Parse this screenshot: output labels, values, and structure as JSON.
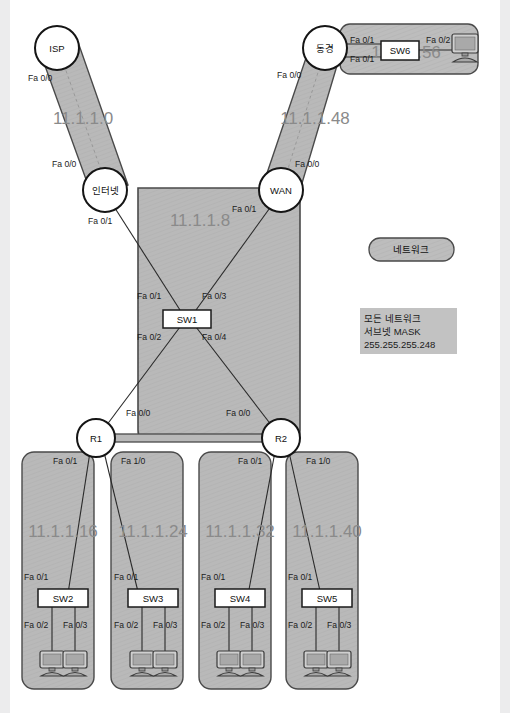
{
  "page": {
    "clipped_header_text": "",
    "background_color": "#ffffff",
    "margin_color": "#ececed"
  },
  "colors": {
    "segment_fill": "#b9b9b9",
    "segment_stroke": "#4a4a4a",
    "node_fill": "#ffffff",
    "node_stroke": "#151515",
    "network_label": "#8a8a8a",
    "legend_fill": "#c2c2c2",
    "pc_fill": "#b0b0b0",
    "pc_stroke": "#3a3a3a"
  },
  "routers": [
    {
      "id": "isp",
      "label": "ISP",
      "cx": 57,
      "cy": 48
    },
    {
      "id": "tokyo",
      "label": "동경",
      "cx": 325,
      "cy": 48
    },
    {
      "id": "internet",
      "label": "인터넷",
      "cx": 105,
      "cy": 190
    },
    {
      "id": "wan",
      "label": "WAN",
      "cx": 281,
      "cy": 190
    },
    {
      "id": "r1",
      "label": "R1",
      "cx": 96,
      "cy": 438
    },
    {
      "id": "r2",
      "label": "R2",
      "cx": 281,
      "cy": 438
    }
  ],
  "switches": [
    {
      "id": "sw1",
      "label": "SW1",
      "x": 163,
      "y": 310,
      "w": 48,
      "h": 17
    },
    {
      "id": "sw6",
      "label": "SW6",
      "x": 381,
      "y": 41,
      "w": 38,
      "h": 19
    },
    {
      "id": "sw2",
      "label": "SW2",
      "x": 38,
      "y": 589,
      "w": 50,
      "h": 18
    },
    {
      "id": "sw3",
      "label": "SW3",
      "x": 128,
      "y": 589,
      "w": 50,
      "h": 18
    },
    {
      "id": "sw4",
      "label": "SW4",
      "x": 215,
      "y": 589,
      "w": 50,
      "h": 18
    },
    {
      "id": "sw5",
      "label": "SW5",
      "x": 302,
      "y": 589,
      "w": 50,
      "h": 18
    }
  ],
  "networks": [
    {
      "id": "net-11-1-1-0",
      "label": "11.1.1.0",
      "x": 83,
      "y": 124
    },
    {
      "id": "net-11-1-1-48",
      "label": "11.1.1.48",
      "x": 315,
      "y": 124
    },
    {
      "id": "net-11-1-1-8",
      "label": "11.1.1.8",
      "x": 200,
      "y": 226
    },
    {
      "id": "net-11-1-1-56",
      "label": "11.1.1.56",
      "x": 406,
      "y": 58
    },
    {
      "id": "net-11-1-1-16",
      "label": "11.1.1.16",
      "x": 63,
      "y": 537
    },
    {
      "id": "net-11-1-1-24",
      "label": "11.1.1.24",
      "x": 153,
      "y": 537
    },
    {
      "id": "net-11-1-1-32",
      "label": "11.1.1.32",
      "x": 240,
      "y": 537
    },
    {
      "id": "net-11-1-1-40",
      "label": "11.1.1.40",
      "x": 327,
      "y": 537
    }
  ],
  "interface_labels": [
    {
      "id": "if-isp-fa00",
      "text": "Fa 0/0",
      "x": 28,
      "y": 81,
      "anchor": "start"
    },
    {
      "id": "if-internet-fa00",
      "text": "Fa 0/0",
      "x": 52,
      "y": 167,
      "anchor": "start"
    },
    {
      "id": "if-tokyo-fa00",
      "text": "Fa 0/0",
      "x": 277,
      "y": 78,
      "anchor": "start"
    },
    {
      "id": "if-wan-fa00",
      "text": "Fa 0/0",
      "x": 295,
      "y": 167,
      "anchor": "start"
    },
    {
      "id": "if-tokyo-fa01-a",
      "text": "Fa 0/1",
      "x": 350,
      "y": 43,
      "anchor": "start"
    },
    {
      "id": "if-tokyo-fa01-b",
      "text": "Fa 0/1",
      "x": 350,
      "y": 62,
      "anchor": "start"
    },
    {
      "id": "if-sw6-fa02",
      "text": "Fa 0/2",
      "x": 426,
      "y": 43,
      "anchor": "start"
    },
    {
      "id": "if-internet-fa01",
      "text": "Fa 0/1",
      "x": 88,
      "y": 224,
      "anchor": "start"
    },
    {
      "id": "if-wan-fa01",
      "text": "Fa 0/1",
      "x": 232,
      "y": 212,
      "anchor": "start"
    },
    {
      "id": "if-sw1-fa01",
      "text": "Fa 0/1",
      "x": 137,
      "y": 299,
      "anchor": "start"
    },
    {
      "id": "if-sw1-fa03",
      "text": "Fa 0/3",
      "x": 202,
      "y": 299,
      "anchor": "start"
    },
    {
      "id": "if-sw1-fa02",
      "text": "Fa 0/2",
      "x": 137,
      "y": 340,
      "anchor": "start"
    },
    {
      "id": "if-sw1-fa04",
      "text": "Fa 0/4",
      "x": 202,
      "y": 340,
      "anchor": "start"
    },
    {
      "id": "if-r1-fa00",
      "text": "Fa 0/0",
      "x": 126,
      "y": 416,
      "anchor": "start"
    },
    {
      "id": "if-r2-fa00",
      "text": "Fa 0/0",
      "x": 226,
      "y": 416,
      "anchor": "start"
    },
    {
      "id": "if-r1-fa01",
      "text": "Fa 0/1",
      "x": 53,
      "y": 464,
      "anchor": "start"
    },
    {
      "id": "if-r1-fa10",
      "text": "Fa 1/0",
      "x": 121,
      "y": 464,
      "anchor": "start"
    },
    {
      "id": "if-r2-fa01",
      "text": "Fa 0/1",
      "x": 238,
      "y": 464,
      "anchor": "start"
    },
    {
      "id": "if-r2-fa10",
      "text": "Fa 1/0",
      "x": 306,
      "y": 464,
      "anchor": "start"
    },
    {
      "id": "if-sw2-fa01",
      "text": "Fa 0/1",
      "x": 24,
      "y": 580,
      "anchor": "start"
    },
    {
      "id": "if-sw3-fa01",
      "text": "Fa 0/1",
      "x": 114,
      "y": 580,
      "anchor": "start"
    },
    {
      "id": "if-sw4-fa01",
      "text": "Fa 0/1",
      "x": 201,
      "y": 580,
      "anchor": "start"
    },
    {
      "id": "if-sw5-fa01",
      "text": "Fa 0/1",
      "x": 288,
      "y": 580,
      "anchor": "start"
    },
    {
      "id": "if-sw2-fa02",
      "text": "Fa 0/2",
      "x": 24,
      "y": 628,
      "anchor": "start"
    },
    {
      "id": "if-sw2-fa03",
      "text": "Fa 0/3",
      "x": 63,
      "y": 628,
      "anchor": "start"
    },
    {
      "id": "if-sw3-fa02",
      "text": "Fa 0/2",
      "x": 114,
      "y": 628,
      "anchor": "start"
    },
    {
      "id": "if-sw3-fa03",
      "text": "Fa 0/3",
      "x": 153,
      "y": 628,
      "anchor": "start"
    },
    {
      "id": "if-sw4-fa02",
      "text": "Fa 0/2",
      "x": 201,
      "y": 628,
      "anchor": "start"
    },
    {
      "id": "if-sw4-fa03",
      "text": "Fa 0/3",
      "x": 240,
      "y": 628,
      "anchor": "start"
    },
    {
      "id": "if-sw5-fa02",
      "text": "Fa 0/2",
      "x": 288,
      "y": 628,
      "anchor": "start"
    },
    {
      "id": "if-sw5-fa03",
      "text": "Fa 0/3",
      "x": 327,
      "y": 628,
      "anchor": "start"
    }
  ],
  "legend": {
    "pill_label": "네트워크",
    "note_lines": [
      "모든 네트워크",
      "서브넷 MASK",
      "255.255.255.248"
    ]
  }
}
